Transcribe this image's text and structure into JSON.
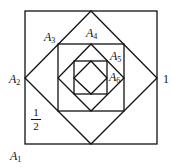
{
  "diagram": {
    "stroke_color": "#111111",
    "labels": {
      "A1": {
        "letter": "A",
        "sub": "1"
      },
      "A2": {
        "letter": "A",
        "sub": "2"
      },
      "A3": {
        "letter": "A",
        "sub": "3"
      },
      "A4": {
        "letter": "A",
        "sub": "4"
      },
      "A5": {
        "letter": "A",
        "sub": "5"
      },
      "A6": {
        "letter": "A",
        "sub": "6"
      }
    },
    "side_label": "1",
    "half_label": {
      "numerator": "1",
      "denominator": "2"
    }
  }
}
